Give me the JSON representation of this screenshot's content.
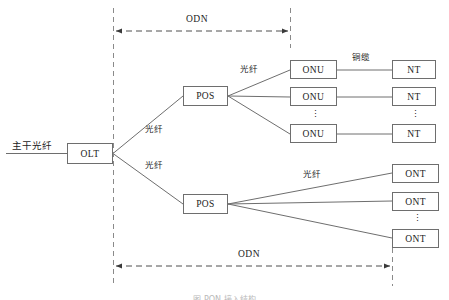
{
  "figure": {
    "caption": "图  PON 接入结构",
    "background_color": "#ffffff",
    "line_color": "#6e6e6e",
    "text_color": "#1c1c1c"
  },
  "trunk": {
    "label": "主干光纤"
  },
  "spans": [
    {
      "name": "odn-top",
      "label": "ODN"
    },
    {
      "name": "odn-bottom",
      "label": "ODN"
    }
  ],
  "nodes": {
    "olt": {
      "label": "OLT"
    },
    "pos_upper": {
      "label": "POS"
    },
    "pos_lower": {
      "label": "POS"
    },
    "onu": [
      {
        "label": "ONU"
      },
      {
        "label": "ONU"
      },
      {
        "label": "ONU"
      }
    ],
    "nt": [
      {
        "label": "NT"
      },
      {
        "label": "NT"
      },
      {
        "label": "NT"
      }
    ],
    "ont": [
      {
        "label": "ONT"
      },
      {
        "label": "ONT"
      },
      {
        "label": "ONT"
      }
    ]
  },
  "edge_labels": {
    "olt_to_pos_upper": "光纤",
    "olt_to_pos_lower": "光纤",
    "pos_upper_to_onu": "光纤",
    "pos_lower_to_ont": "光纤",
    "onu_to_nt": "铜缆"
  },
  "ellipsis": {
    "glyph": "⋮"
  }
}
